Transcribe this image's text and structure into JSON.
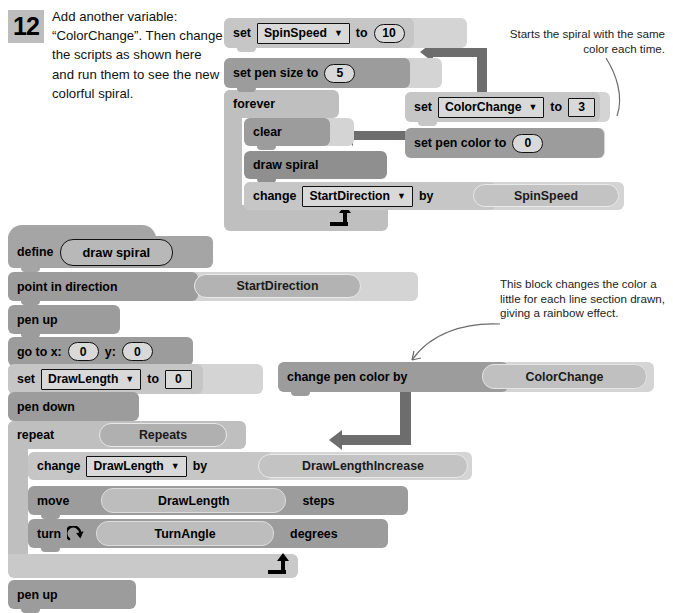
{
  "step": {
    "number": "12",
    "text": "Add another variable: “ColorChange”. Then change the scripts as shown here and run them to see the new colorful spiral."
  },
  "annotations": [
    {
      "id": "annot-1",
      "text": "Starts the spiral with the same color each time.",
      "align": "right"
    },
    {
      "id": "annot-2",
      "text": "This block changes the color a little for each line section drawn, giving a rainbow effect.",
      "align": "left"
    }
  ],
  "scripts": {
    "main": {
      "name": "main-script",
      "blocks": {
        "set_spinspeed": {
          "label": "set",
          "variable": "SpinSpeed",
          "to_label": "to",
          "value": "10"
        },
        "set_pen_size": {
          "label": "set pen size to",
          "value": "5"
        },
        "forever": {
          "label": "forever"
        },
        "clear": {
          "label": "clear"
        },
        "draw_spiral": {
          "label": "draw spiral"
        },
        "change_startdirection": {
          "label": "change",
          "variable": "StartDirection",
          "by_label": "by",
          "operand": "SpinSpeed"
        }
      }
    },
    "inserted": {
      "name": "inserted-blocks",
      "blocks": {
        "set_colorchange": {
          "label": "set",
          "variable": "ColorChange",
          "to_label": "to",
          "value": "3"
        },
        "set_pen_color": {
          "label": "set pen color to",
          "value": "0"
        },
        "change_pen_color_by": {
          "label": "change pen color by",
          "operand": "ColorChange"
        }
      }
    },
    "definition": {
      "name": "draw-spiral-definition",
      "blocks": {
        "define": {
          "label": "define",
          "custom_block": "draw spiral"
        },
        "point_direction": {
          "label": "point in direction",
          "operand": "StartDirection"
        },
        "pen_up_top": {
          "label": "pen up"
        },
        "go_to_xy": {
          "x_label": "go to x:",
          "x": "0",
          "y_label": "y:",
          "y": "0"
        },
        "set_drawlength": {
          "label": "set",
          "variable": "DrawLength",
          "to_label": "to",
          "value": "0"
        },
        "pen_down": {
          "label": "pen down"
        },
        "repeat": {
          "label": "repeat",
          "operand": "Repeats"
        },
        "change_drawlength": {
          "label": "change",
          "variable": "DrawLength",
          "by_label": "by",
          "operand": "DrawLengthIncrease"
        },
        "move": {
          "label": "move",
          "operand": "DrawLength",
          "unit": "steps"
        },
        "turn": {
          "label": "turn",
          "icon": "turn-right-icon",
          "operand": "TurnAngle",
          "unit": "degrees"
        },
        "pen_up_bottom": {
          "label": "pen up"
        }
      }
    }
  },
  "icons": {
    "dropdown_caret": "▼",
    "loop_arrow": "loop-arrow-icon",
    "turn_right": "turn-right-icon"
  },
  "colors": {
    "variable_block": "#c6c6c6",
    "pen_block": "#9c9c9c",
    "control_block": "#bfbfbf",
    "call_block": "#8f8f8f",
    "define_block": "#a5a5a5",
    "pointer_arrow": "#6d6d6d",
    "badge": "#bdbdbd",
    "page_background": "#ffffff"
  }
}
